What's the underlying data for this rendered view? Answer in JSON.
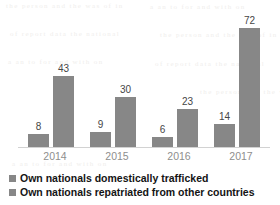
{
  "chart_data": {
    "type": "bar",
    "title": "",
    "subtitle": "",
    "xlabel": "",
    "ylabel": "",
    "grid": false,
    "axis_visible": {
      "x": true,
      "y": false
    },
    "ylim": [
      0,
      83
    ],
    "legend_position": "bottom-left",
    "categories": [
      "2014",
      "2015",
      "2016",
      "2017"
    ],
    "series": [
      {
        "name": "Own nationals domestically trafficked",
        "color": "#878787",
        "values": [
          8,
          9,
          6,
          14
        ],
        "labels": [
          "8",
          "9",
          "6",
          "14"
        ]
      },
      {
        "name": "Own nationals repatriated from other countries",
        "color": "#878787",
        "values": [
          43,
          30,
          23,
          72
        ],
        "labels": [
          "43",
          "30",
          "23",
          "72"
        ]
      }
    ]
  },
  "colors": {
    "bar": "#878787",
    "axis": "#d2d2d2",
    "value_label": "#464646",
    "category_label": "#8e8e8e",
    "legend_text": "#141414",
    "background": "#ffffff"
  },
  "artifacts": {
    "bleed_1": "the  person  and  the  was  of  in",
    "bleed_2": "a  an  to  for  and  with  on",
    "bleed_3": "of  report  data  the  national"
  }
}
